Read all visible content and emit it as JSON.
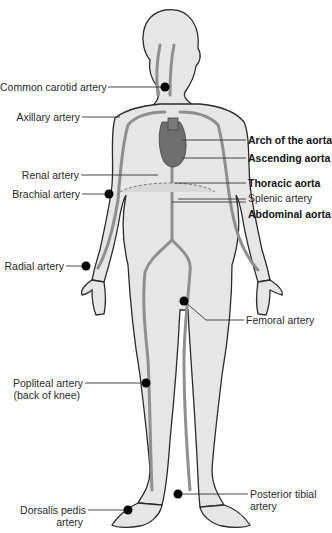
{
  "diagram": {
    "labels_left": [
      {
        "id": "common-carotid",
        "text": "Common carotid artery",
        "bold": false
      },
      {
        "id": "axillary",
        "text": "Axillary artery",
        "bold": false
      },
      {
        "id": "renal",
        "text": "Renal artery",
        "bold": false
      },
      {
        "id": "brachial",
        "text": "Brachial artery",
        "bold": false
      },
      {
        "id": "radial",
        "text": "Radial artery",
        "bold": false
      },
      {
        "id": "popliteal",
        "text": "Popliteal artery",
        "bold": false
      },
      {
        "id": "popliteal-sub",
        "text": "(back of knee)",
        "bold": false
      },
      {
        "id": "dorsalis-pedis",
        "text": "Dorsalis pedis",
        "bold": false
      },
      {
        "id": "dorsalis-pedis-sub",
        "text": "artery",
        "bold": false
      }
    ],
    "labels_right": [
      {
        "id": "arch-aorta",
        "text": "Arch of the aorta",
        "bold": true
      },
      {
        "id": "ascending-aorta",
        "text": "Ascending aorta",
        "bold": true
      },
      {
        "id": "thoracic-aorta",
        "text": "Thoracic aorta",
        "bold": true
      },
      {
        "id": "splenic",
        "text": "Splenic artery",
        "bold": false
      },
      {
        "id": "abdominal-aorta",
        "text": "Abdominal aorta",
        "bold": true
      },
      {
        "id": "femoral",
        "text": "Femoral artery",
        "bold": false
      },
      {
        "id": "posterior-tibial",
        "text": "Posterior tibial",
        "bold": false
      },
      {
        "id": "posterior-tibial-sub",
        "text": "artery",
        "bold": false
      }
    ],
    "colors": {
      "body_fill": "#e6e6e6",
      "outline": "#2b2b2b",
      "artery": "#8f8f8f",
      "heart": "#6e6e6e",
      "pulse_dot": "#000000",
      "leader": "#333333"
    }
  }
}
